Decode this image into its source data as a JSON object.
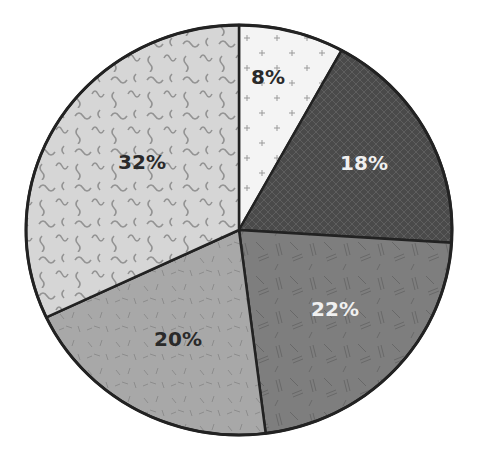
{
  "chart_data": {
    "type": "pie",
    "title": "",
    "start_angle_deg": 0,
    "direction": "clockwise",
    "categories": [
      "Slice A",
      "Slice B",
      "Slice C",
      "Slice D",
      "Slice E"
    ],
    "values": [
      8,
      18,
      22,
      20,
      32
    ],
    "labels": [
      "8%",
      "18%",
      "22%",
      "20%",
      "32%"
    ],
    "legend": "none",
    "slices": [
      {
        "value": 8,
        "label": "8%",
        "fill": "#f4f4f4",
        "pattern": "plus-signs",
        "pattern_color": "#9a9a9a",
        "text_color": "#2a2a2a",
        "label_pos": [
          268,
          78
        ]
      },
      {
        "value": 18,
        "label": "18%",
        "fill": "#4a4a4a",
        "pattern": "crosshatch",
        "pattern_color": "#5c5c5c",
        "text_color": "#f0f0f0",
        "label_pos": [
          364,
          164
        ]
      },
      {
        "value": 22,
        "label": "22%",
        "fill": "#7e7e7e",
        "pattern": "dashes",
        "pattern_color": "#606060",
        "text_color": "#f0f0f0",
        "label_pos": [
          335,
          310
        ]
      },
      {
        "value": 20,
        "label": "20%",
        "fill": "#a8a8a8",
        "pattern": "short-strokes",
        "pattern_color": "#8a8a8a",
        "text_color": "#2a2a2a",
        "label_pos": [
          178,
          340
        ]
      },
      {
        "value": 32,
        "label": "32%",
        "fill": "#d6d6d6",
        "pattern": "squiggles",
        "pattern_color": "#8e8e8e",
        "text_color": "#2a2a2a",
        "label_pos": [
          142,
          163
        ]
      }
    ],
    "geometry": {
      "cx": 239,
      "cy": 230,
      "rx": 213,
      "ry": 205
    },
    "outline_color": "#222222"
  }
}
